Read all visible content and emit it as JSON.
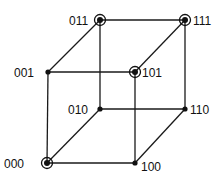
{
  "diagram": {
    "type": "binary-hypercube-3d",
    "colors": {
      "line": "#1a1a1a",
      "node": "#111111",
      "background": "#ffffff"
    },
    "nodes": [
      {
        "id": "000",
        "label": "000",
        "x": 47,
        "y": 163,
        "circled": true,
        "label_side": "left",
        "lx": 4,
        "ly": 168
      },
      {
        "id": "001",
        "label": "001",
        "x": 48,
        "y": 72,
        "circled": false,
        "label_side": "left",
        "lx": 14,
        "ly": 77
      },
      {
        "id": "010",
        "label": "010",
        "x": 100,
        "y": 109,
        "circled": false,
        "label_side": "left",
        "lx": 68,
        "ly": 114
      },
      {
        "id": "011",
        "label": "011",
        "x": 100,
        "y": 20,
        "circled": true,
        "label_side": "left",
        "lx": 69,
        "ly": 25
      },
      {
        "id": "100",
        "label": "100",
        "x": 135,
        "y": 163,
        "circled": false,
        "label_side": "right",
        "lx": 141,
        "ly": 171
      },
      {
        "id": "101",
        "label": "101",
        "x": 135,
        "y": 72,
        "circled": true,
        "label_side": "right",
        "lx": 142,
        "ly": 77
      },
      {
        "id": "110",
        "label": "110",
        "x": 185,
        "y": 109,
        "circled": false,
        "label_side": "right",
        "lx": 190,
        "ly": 114
      },
      {
        "id": "111",
        "label": "111",
        "x": 185,
        "y": 20,
        "circled": true,
        "label_side": "right",
        "lx": 193,
        "ly": 25
      }
    ],
    "edges": [
      [
        "000",
        "001"
      ],
      [
        "000",
        "010"
      ],
      [
        "000",
        "100"
      ],
      [
        "001",
        "011"
      ],
      [
        "001",
        "101"
      ],
      [
        "010",
        "011"
      ],
      [
        "010",
        "110"
      ],
      [
        "100",
        "101"
      ],
      [
        "100",
        "110"
      ],
      [
        "011",
        "111"
      ],
      [
        "101",
        "111"
      ],
      [
        "110",
        "111"
      ]
    ]
  }
}
